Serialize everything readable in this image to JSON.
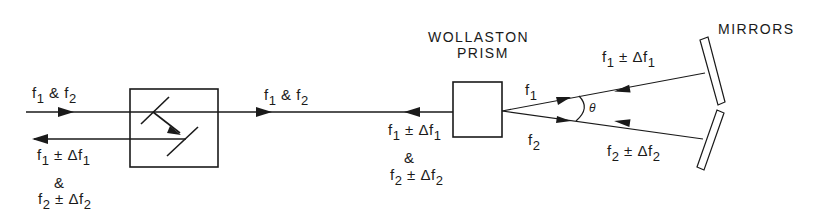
{
  "title_prism": [
    "WOLLASTON",
    "PRISM"
  ],
  "title_mirrors": "MIRRORS",
  "labels": {
    "input_left": {
      "a": "f",
      "a_sub": "1",
      "amp": "&",
      "b": "f",
      "b_sub": "2"
    },
    "return_left_1": {
      "a": "f",
      "a_sub": "1",
      "rest": "± Δf",
      "rest_sub": "1"
    },
    "return_left_amp": "&",
    "return_left_2": {
      "a": "f",
      "a_sub": "2",
      "rest": "± Δf",
      "rest_sub": "2"
    },
    "mid_forward": {
      "a": "f",
      "a_sub": "1",
      "amp": "&",
      "b": "f",
      "b_sub": "2"
    },
    "mid_return_1": {
      "a": "f",
      "a_sub": "1",
      "rest": "± Δf",
      "rest_sub": "1"
    },
    "mid_return_amp": "&",
    "mid_return_2": {
      "a": "f",
      "a_sub": "2",
      "rest": "± Δf",
      "rest_sub": "2"
    },
    "beam_f1": {
      "a": "f",
      "a_sub": "1"
    },
    "beam_f2": {
      "a": "f",
      "a_sub": "2"
    },
    "angle": "θ",
    "mirror_return_1": {
      "a": "f",
      "a_sub": "1",
      "rest": "± Δf",
      "rest_sub": "1"
    },
    "mirror_return_2": {
      "a": "f",
      "a_sub": "2",
      "rest": "± Δf",
      "rest_sub": "2"
    }
  }
}
